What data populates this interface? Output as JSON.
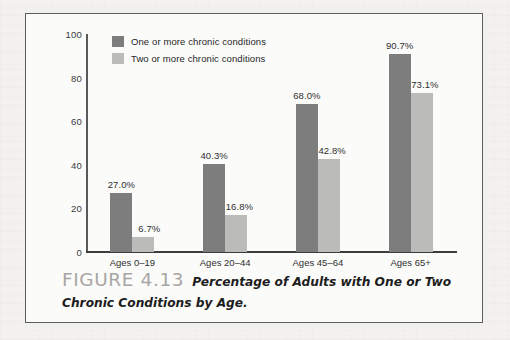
{
  "figure": {
    "label": "FIGURE 4.13",
    "caption": "Percentage of Adults with One or Two Chronic Conditions by Age."
  },
  "legend": {
    "position": "top-left-inside",
    "items": [
      {
        "label": "One or more chronic conditions",
        "color": "#7d7d7d",
        "swatch_name": "legend-swatch-dark"
      },
      {
        "label": "Two or more chronic conditions",
        "color": "#bbbbba",
        "swatch_name": "legend-swatch-light"
      }
    ]
  },
  "chart_data": {
    "type": "bar",
    "title": "Percentage of Adults with One or Two Chronic Conditions by Age.",
    "xlabel": "",
    "ylabel": "",
    "ylim": [
      0,
      100
    ],
    "yticks": [
      0,
      20,
      40,
      60,
      80,
      100
    ],
    "ytick_labels": [
      "0",
      "20",
      "40",
      "60",
      "80",
      "100"
    ],
    "grid": false,
    "legend_position": "upper left",
    "categories": [
      "Ages 0–19",
      "Ages 20–44",
      "Ages 45–64",
      "Ages 65+"
    ],
    "series": [
      {
        "name": "One or more chronic conditions",
        "color": "#7d7d7d",
        "values": [
          27.0,
          40.3,
          68.0,
          90.7
        ],
        "value_labels": [
          "27.0%",
          "40.3%",
          "68.0%",
          "90.7%"
        ]
      },
      {
        "name": "Two or more chronic conditions",
        "color": "#bbbbba",
        "values": [
          6.7,
          16.8,
          42.8,
          73.1
        ],
        "value_labels": [
          "6.7%",
          "16.8%",
          "42.8%",
          "73.1%"
        ]
      }
    ]
  }
}
